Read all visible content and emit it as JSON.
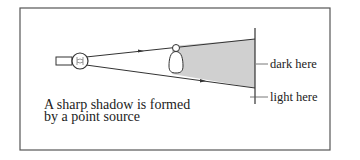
{
  "diagram": {
    "caption_line1": "A sharp shadow is formed",
    "caption_line2": "by a point source",
    "labels": {
      "dark": "dark here",
      "light": "light here"
    },
    "colors": {
      "shadow_fill": "#d0d0d0",
      "stroke": "#333333",
      "frame": "#555555"
    },
    "elements": [
      "point-source-bulb",
      "light-rays",
      "opaque-object",
      "shadow-region",
      "screen"
    ]
  }
}
